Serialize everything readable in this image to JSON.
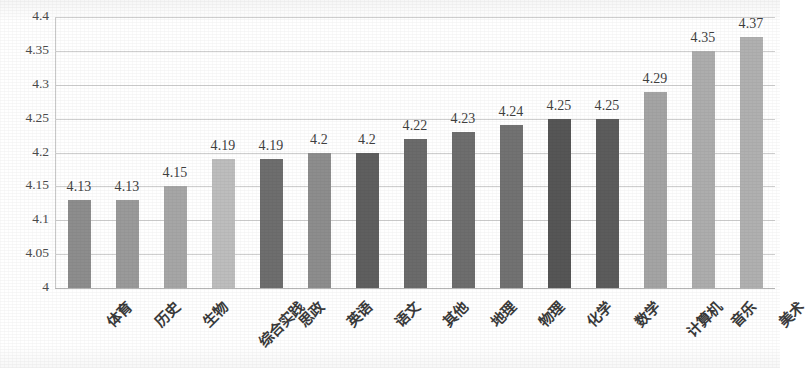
{
  "chart_data": {
    "type": "bar",
    "title": "",
    "subtitle": "",
    "xlabel": "",
    "ylabel": "",
    "ylim": [
      4,
      4.4
    ],
    "ytick_step": 0.05,
    "yticks": [
      "4.4",
      "4.35",
      "4.3",
      "4.25",
      "4.2",
      "4.15",
      "4.1",
      "4.05",
      "4"
    ],
    "grid": true,
    "legend": "none",
    "x_label_rotation": -45,
    "categories": [
      "体育",
      "历史",
      "生物",
      "综合实践",
      "思政",
      "英语",
      "语文",
      "其他",
      "地理",
      "物理",
      "化学",
      "数学",
      "计算机",
      "音乐",
      "美术"
    ],
    "values": [
      4.13,
      4.13,
      4.15,
      4.19,
      4.19,
      4.2,
      4.2,
      4.22,
      4.23,
      4.24,
      4.25,
      4.25,
      4.29,
      4.35,
      4.37
    ],
    "data_labels": [
      "4.13",
      "4.13",
      "4.15",
      "4.19",
      "4.19",
      "4.2",
      "4.2",
      "4.22",
      "4.23",
      "4.24",
      "4.25",
      "4.25",
      "4.29",
      "4.35",
      "4.37"
    ],
    "bar_colors": [
      "#8d8d8d",
      "#9a9a9a",
      "#a6a6a6",
      "#bdbdbd",
      "#6e6e6e",
      "#8d8d8d",
      "#5f5f5f",
      "#6b6b6b",
      "#6e6e6e",
      "#727272",
      "#565656",
      "#5c5c5c",
      "#a4a4a4",
      "#adadad",
      "#b0b0b0"
    ]
  },
  "style": {
    "gridline_color": "#cfcfcf",
    "baseline_color": "#b4b4b4",
    "axis_color": "#c9c9c9",
    "text_color": "#3f3f3f",
    "background": "#ffffff"
  }
}
